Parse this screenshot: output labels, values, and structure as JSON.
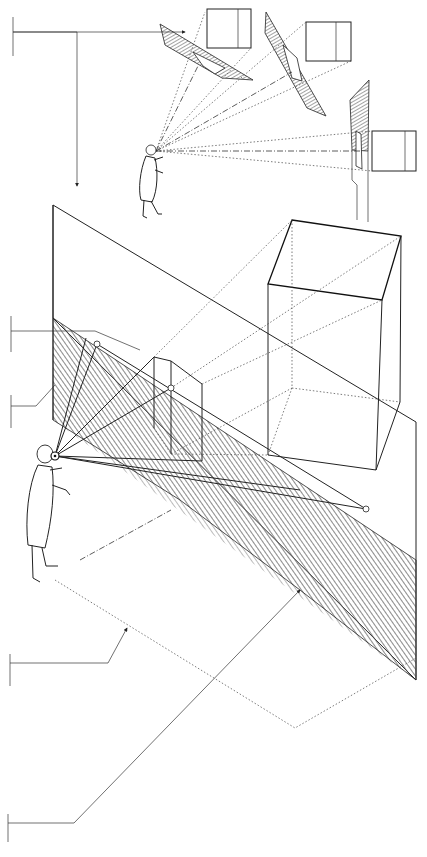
{
  "diagram": {
    "title": "",
    "labels": [],
    "colors": {
      "ink": "#222222",
      "background": "#ffffff",
      "hatch": "#555555"
    },
    "elements": [
      {
        "id": "observer-main",
        "type": "figure"
      },
      {
        "id": "observer-small",
        "type": "figure"
      },
      {
        "id": "picture-plane",
        "type": "plane",
        "hatched_part": "lower"
      },
      {
        "id": "large-box",
        "type": "prism"
      },
      {
        "id": "projected-box",
        "type": "prism"
      },
      {
        "id": "inset-panel-1",
        "type": "tilted-plane-with-square"
      },
      {
        "id": "inset-panel-2",
        "type": "tilted-plane-with-square"
      },
      {
        "id": "inset-panel-3",
        "type": "tilted-plane-with-square"
      },
      {
        "id": "leader-lines",
        "count": 5
      }
    ]
  }
}
